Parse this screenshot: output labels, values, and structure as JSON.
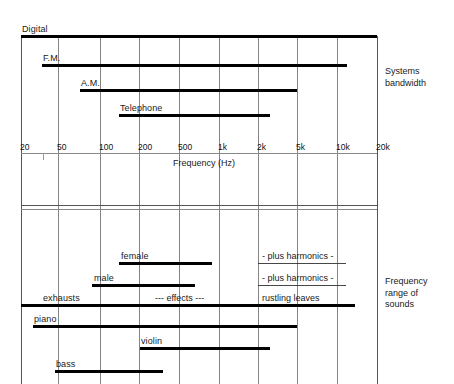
{
  "title_alt": "Frequency ranges of systems and sounds",
  "axis": {
    "label": "Frequency (Hz)",
    "ticks": [
      {
        "text": "20",
        "x": 21
      },
      {
        "text": "50",
        "x": 58
      },
      {
        "text": "100",
        "x": 100
      },
      {
        "text": "200",
        "x": 139
      },
      {
        "text": "500",
        "x": 179
      },
      {
        "text": "1k",
        "x": 219
      },
      {
        "text": "2k",
        "x": 258
      },
      {
        "text": "5k",
        "x": 297
      },
      {
        "text": "10k",
        "x": 337
      },
      {
        "text": "20k",
        "x": 377
      }
    ]
  },
  "side_labels": [
    {
      "name": "systems-bandwidth",
      "lines": [
        "Systems",
        "bandwidth"
      ],
      "x": 385,
      "y": 66
    },
    {
      "name": "frequency-range-of-sounds",
      "lines": [
        "Frequency",
        "range of",
        "sounds"
      ],
      "x": 385,
      "y": 276
    }
  ],
  "systems": {
    "section_name": "Systems bandwidth",
    "bars": [
      {
        "name": "digital",
        "label": "Digital",
        "x1": 21,
        "x2": 377,
        "y": 36,
        "label_x": 22,
        "label_y": 24
      },
      {
        "name": "fm",
        "label": "F.M.",
        "x1": 42,
        "x2": 347,
        "y": 65,
        "label_x": 43,
        "label_y": 53
      },
      {
        "name": "am",
        "label": "A.M.",
        "x1": 80,
        "x2": 297,
        "y": 90,
        "label_x": 81,
        "label_y": 78
      },
      {
        "name": "telephone",
        "label": "Telephone",
        "x1": 119,
        "x2": 270,
        "y": 115,
        "label_x": 120,
        "label_y": 103
      }
    ]
  },
  "sounds": {
    "section_name": "Frequency range of sounds",
    "bars": [
      {
        "name": "female",
        "label": "female",
        "x1": 119,
        "x2": 212,
        "y": 263,
        "label_x": 121,
        "label_y": 251
      },
      {
        "name": "male",
        "label": "male",
        "x1": 92,
        "x2": 195,
        "y": 285,
        "label_x": 94,
        "label_y": 273
      },
      {
        "name": "exhausts",
        "label": "exhausts",
        "x1": 21,
        "x2": 355,
        "y": 305,
        "label_x": 43,
        "label_y": 293
      },
      {
        "name": "piano",
        "label": "piano",
        "x1": 33,
        "x2": 297,
        "y": 326,
        "label_x": 34,
        "label_y": 314
      },
      {
        "name": "violin",
        "label": "violin",
        "x1": 140,
        "x2": 270,
        "y": 348,
        "label_x": 141,
        "label_y": 336
      },
      {
        "name": "bass",
        "label": "bass",
        "x1": 55,
        "x2": 163,
        "y": 371,
        "label_x": 56,
        "label_y": 359
      }
    ],
    "annotations": [
      {
        "name": "female-harmonics",
        "text": "-  plus harmonics  -",
        "x": 262,
        "y": 251,
        "underline": {
          "x1": 258,
          "x2": 346,
          "y": 263
        }
      },
      {
        "name": "male-harmonics",
        "text": "-  plus harmonics  -",
        "x": 262,
        "y": 273,
        "underline": {
          "x1": 258,
          "x2": 346,
          "y": 285
        }
      },
      {
        "name": "effects",
        "text": "---  effects  ---",
        "x": 155,
        "y": 293
      },
      {
        "name": "rustling-leaves",
        "text": "rustling leaves",
        "x": 262,
        "y": 293
      }
    ]
  },
  "chart_data": {
    "type": "bar",
    "xlabel": "Frequency (Hz)",
    "ylabel": "",
    "x_scale": "log",
    "xlim": [
      20,
      20000
    ],
    "xticks": [
      20,
      50,
      100,
      200,
      500,
      1000,
      2000,
      5000,
      10000,
      20000
    ],
    "xticklabels": [
      "20",
      "50",
      "100",
      "200",
      "500",
      "1k",
      "2k",
      "5k",
      "10k",
      "20k"
    ],
    "grid": "vertical gridlines at every tick; horizontal frame lines separating panels",
    "legend": "none",
    "panels": [
      {
        "name": "Systems bandwidth",
        "ranges": [
          {
            "label": "Digital",
            "f_low": 20,
            "f_high": 20000
          },
          {
            "label": "F.M.",
            "f_low": 30,
            "f_high": 12000
          },
          {
            "label": "A.M.",
            "f_low": 75,
            "f_high": 5000
          },
          {
            "label": "Telephone",
            "f_low": 180,
            "f_high": 2800
          }
        ]
      },
      {
        "name": "Frequency range of sounds",
        "ranges": [
          {
            "label": "female",
            "f_low": 180,
            "f_high": 800,
            "note": "- plus harmonics -"
          },
          {
            "label": "male",
            "f_low": 90,
            "f_high": 500,
            "note": "- plus harmonics -"
          },
          {
            "label": "exhausts",
            "f_low": 20,
            "f_high": 16000,
            "note": "--- effects ---, rustling leaves"
          },
          {
            "label": "piano",
            "f_low": 27,
            "f_high": 5000
          },
          {
            "label": "violin",
            "f_low": 200,
            "f_high": 2800
          },
          {
            "label": "bass",
            "f_low": 45,
            "f_high": 350
          }
        ]
      }
    ]
  },
  "geometry": {
    "frame": {
      "left": 21,
      "right": 377,
      "top": 36,
      "bottom": 384
    },
    "gridlines_x": [
      21,
      58,
      100,
      139,
      179,
      219,
      258,
      297,
      337,
      377
    ],
    "gridlines_y": [
      36,
      153,
      205,
      209
    ],
    "axis_line_y": 153,
    "axis_title_x": 173,
    "axis_title_y": 158,
    "minor_tick": {
      "x": 43,
      "y1": 153,
      "y2": 160
    }
  }
}
